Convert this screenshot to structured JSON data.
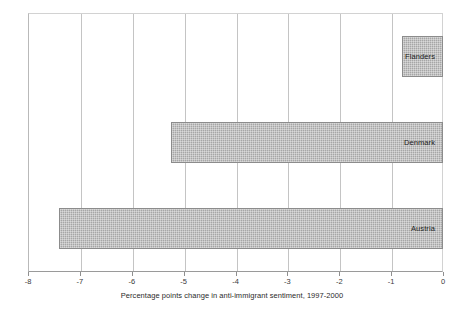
{
  "chart_data": {
    "type": "bar",
    "orientation": "horizontal",
    "title": "",
    "xlabel": "Percentage points change in anti-immigrant sentiment, 1997-2000",
    "ylabel": "",
    "categories": [
      "Flanders",
      "Denmark",
      "Austria"
    ],
    "values": [
      -0.8,
      -5.25,
      -7.4
    ],
    "xlim": [
      -8,
      0
    ],
    "xticks": [
      -8,
      -7,
      -6,
      -5,
      -4,
      -3,
      -2,
      -1,
      0
    ],
    "xtick_labels": [
      "-8",
      "-7",
      "-6",
      "-5",
      "-4",
      "-3",
      "-2",
      "-1",
      "0"
    ],
    "grid": true,
    "grid_axis": "x",
    "legend": false,
    "bar_fill": "#a6a6a6",
    "bar_border": "#8c8c8c",
    "labels_inside_bars": true
  },
  "axis": {
    "title": "Percentage points change in anti-immigrant sentiment, 1997-2000"
  },
  "bars": [
    {
      "label": "Flanders",
      "value": -0.8
    },
    {
      "label": "Denmark",
      "value": -5.25
    },
    {
      "label": "Austria",
      "value": -7.4
    }
  ]
}
